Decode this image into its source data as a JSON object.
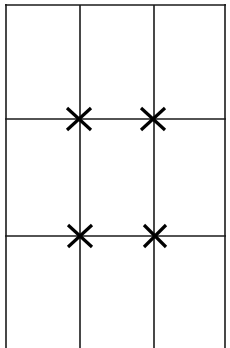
{
  "canvas": {
    "width": 230,
    "height": 348,
    "background_color": "#ffffff"
  },
  "diagram": {
    "type": "line-drawing",
    "line_color": "#1a1a1a",
    "mark_color": "#000000",
    "grid": {
      "line_width": 1.6,
      "vertical_lines": [
        {
          "name": "left-border",
          "x": 6,
          "y1": 4,
          "y2": 348
        },
        {
          "name": "vertical-line-1",
          "x": 80,
          "y1": 5,
          "y2": 348
        },
        {
          "name": "vertical-line-2",
          "x": 154,
          "y1": 5,
          "y2": 348
        },
        {
          "name": "right-border",
          "x": 225,
          "y1": 4,
          "y2": 348
        }
      ],
      "horizontal_lines": [
        {
          "name": "top-border",
          "y": 5,
          "x1": 5,
          "x2": 226
        },
        {
          "name": "horizontal-line-1",
          "y": 119,
          "x1": 5,
          "x2": 226
        },
        {
          "name": "horizontal-line-2",
          "y": 236,
          "x1": 5,
          "x2": 226
        }
      ],
      "columns": 3,
      "rows": 3,
      "bottom_open": true
    },
    "x_marks": [
      {
        "name": "x-mark-top-left",
        "cx": 79,
        "cy": 119,
        "half_width": 12,
        "half_height": 11,
        "stroke_width": 3.2
      },
      {
        "name": "x-mark-top-right",
        "cx": 153,
        "cy": 119,
        "half_width": 12,
        "half_height": 11,
        "stroke_width": 3.2
      },
      {
        "name": "x-mark-bottom-left",
        "cx": 80,
        "cy": 236,
        "half_width": 12,
        "half_height": 11,
        "stroke_width": 3.2
      },
      {
        "name": "x-mark-bottom-right",
        "cx": 155,
        "cy": 236,
        "half_width": 11,
        "half_height": 11,
        "stroke_width": 3.2
      }
    ]
  }
}
